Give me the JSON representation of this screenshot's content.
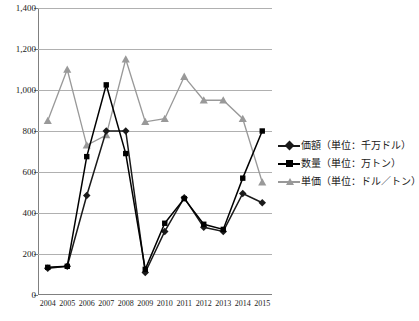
{
  "chart_data": {
    "type": "line",
    "title": "",
    "xlabel": "",
    "ylabel": "",
    "categories": [
      "2004",
      "2005",
      "2006",
      "2007",
      "2008",
      "2009",
      "2010",
      "2011",
      "2012",
      "2013",
      "2014",
      "2015"
    ],
    "ylim": [
      0,
      1400
    ],
    "yticks": [
      0,
      200,
      400,
      600,
      800,
      1000,
      1200,
      1400
    ],
    "ytick_labels": [
      "0",
      "200",
      "400",
      "600",
      "800",
      "1,000",
      "1,200",
      "1,400"
    ],
    "grid": true,
    "legend_position": "right",
    "series": [
      {
        "name": "価額（単位：千万ドル）",
        "marker": "diamond",
        "color": "#1a1a1a",
        "values": [
          130,
          140,
          485,
          800,
          800,
          110,
          310,
          475,
          330,
          310,
          495,
          450
        ]
      },
      {
        "name": "数量（単位：万トン）",
        "marker": "square",
        "color": "#000000",
        "values": [
          135,
          140,
          675,
          1025,
          690,
          125,
          350,
          470,
          345,
          320,
          570,
          800
        ]
      },
      {
        "name": "単価（単位：ドル／トン）",
        "marker": "triangle",
        "color": "#999999",
        "values": [
          850,
          1100,
          730,
          780,
          1150,
          845,
          860,
          1065,
          950,
          950,
          860,
          550
        ]
      }
    ]
  },
  "legend": {
    "entries": [
      {
        "label": "価額（単位：千万ドル）"
      },
      {
        "label": "数量（単位：万トン）"
      },
      {
        "label": "単価（単位：ドル／トン）"
      }
    ]
  }
}
